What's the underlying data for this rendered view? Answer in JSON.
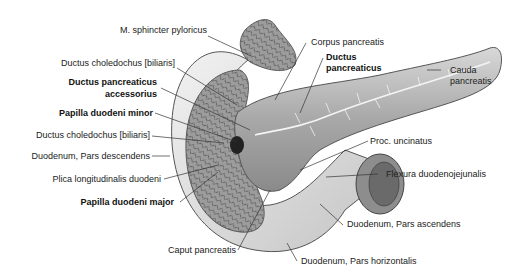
{
  "figure": {
    "labels": {
      "sphincter_pyloricus": "M. sphincter pyloricus",
      "ductus_choledochus_1": "Ductus choledochus [biliaris]",
      "ductus_pancreaticus_accessorius_l1": "Ductus pancreaticus",
      "ductus_pancreaticus_accessorius_l2": "accessorius",
      "papilla_duodeni_minor": "Papilla duodeni minor",
      "ductus_choledochus_2": "Ductus choledochus [biliaris]",
      "duodenum_pars_descendens": "Duodenum, Pars descendens",
      "plica_longitudinalis": "Plica longitudinalis duodeni",
      "papilla_duodeni_major": "Papilla duodeni major",
      "caput_pancreatis": "Caput pancreatis",
      "corpus_pancreatis": "Corpus pancreatis",
      "ductus_pancreaticus_l1": "Ductus",
      "ductus_pancreaticus_l2": "pancreaticus",
      "cauda_pancreatis_l1": "Cauda",
      "cauda_pancreatis_l2": "pancreatis",
      "proc_uncinatus": "Proc. uncinatus",
      "flexura_duodenojejunalis": "Flexura duodenojejunalis",
      "duodenum_pars_ascendens": "Duodenum, Pars ascendens",
      "duodenum_pars_horizontalis": "Duodenum, Pars horizontalis"
    },
    "colors": {
      "tissue_light": "#e6e6e6",
      "tissue_mid": "#b5b5b5",
      "tissue_dark": "#5a5a5a",
      "leader": "#333333"
    }
  }
}
